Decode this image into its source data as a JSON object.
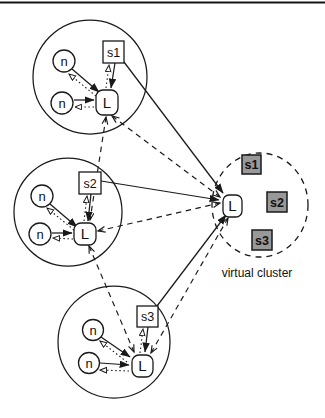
{
  "clusters": [
    {
      "nodes": [
        "n",
        "n"
      ],
      "server": "s1",
      "leader": "L"
    },
    {
      "nodes": [
        "n",
        "n"
      ],
      "server": "s2",
      "leader": "L"
    },
    {
      "nodes": [
        "n",
        "n"
      ],
      "server": "s3",
      "leader": "L"
    }
  ],
  "virtual_cluster": {
    "leader": "L",
    "servers": [
      "s1",
      "s2",
      "s3"
    ],
    "label": "virtual cluster"
  },
  "colors": {
    "ink": "#1a1a1a",
    "server_fill": "#999999",
    "background": "#ffffff"
  }
}
